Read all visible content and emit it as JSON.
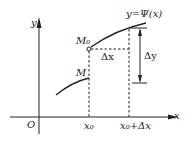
{
  "diagram": {
    "function_label": "y=Ψ(x)",
    "y_axis_label": "y",
    "x_axis_label": "x",
    "origin_label": "O",
    "point_m0": "M₀",
    "point_m": "M",
    "delta_x": "Δx",
    "delta_y": "Δy",
    "tick_x0": "x₀",
    "tick_x0_dx": "x₀+Δx"
  }
}
